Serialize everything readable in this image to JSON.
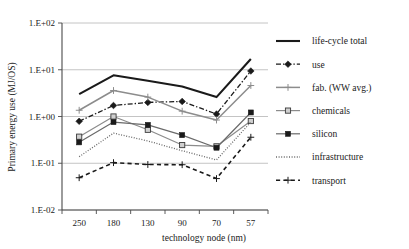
{
  "chart_data": {
    "type": "line",
    "title": "",
    "xlabel": "technology node (nm)",
    "ylabel": "Primary energy use  (MJ/OS)",
    "categories": [
      "250",
      "180",
      "130",
      "90",
      "70",
      "57"
    ],
    "yscale": "log",
    "ylim": [
      0.01,
      100
    ],
    "ytick_labels": [
      "1.E+02",
      "1.E+01",
      "1.E+00",
      "1.E-01",
      "1.E-02"
    ],
    "ytick_values": [
      100,
      10,
      1,
      0.1,
      0.01
    ],
    "grid": "horizontal",
    "legend_position": "right",
    "series": [
      {
        "name": "life-cycle total",
        "style": "solid",
        "color": "#1a1a1a",
        "width": 2.1,
        "marker": "none",
        "values": [
          3.0,
          7.6,
          5.8,
          4.4,
          2.6,
          17.0
        ]
      },
      {
        "name": "use",
        "style": "dashdot",
        "color": "#1a1a1a",
        "width": 1.3,
        "marker": "diamond",
        "values": [
          0.79,
          1.72,
          2.0,
          2.1,
          1.13,
          9.4
        ]
      },
      {
        "name": "fab. (WW avg.)",
        "style": "solid",
        "color": "#8c8c8c",
        "width": 1.5,
        "marker": "plus",
        "values": [
          1.36,
          3.6,
          2.6,
          1.3,
          0.84,
          4.6
        ]
      },
      {
        "name": "chemicals",
        "style": "solid",
        "color": "#8c8c8c",
        "width": 1.2,
        "marker": "square",
        "values": [
          0.37,
          1.0,
          0.52,
          0.245,
          0.23,
          0.8
        ]
      },
      {
        "name": "silicon",
        "style": "solid",
        "color": "#6a6a6a",
        "width": 1.2,
        "marker": "filled-square",
        "values": [
          0.28,
          0.76,
          0.66,
          0.4,
          0.215,
          1.22
        ]
      },
      {
        "name": "infrastructure",
        "style": "dotted",
        "color": "#6a6a6a",
        "width": 1.3,
        "marker": "none",
        "values": [
          0.138,
          0.44,
          0.3,
          0.185,
          0.118,
          0.76
        ]
      },
      {
        "name": "transport",
        "style": "dashed",
        "color": "#1a1a1a",
        "width": 1.6,
        "marker": "plus",
        "values": [
          0.049,
          0.103,
          0.094,
          0.093,
          0.047,
          0.36
        ]
      }
    ]
  }
}
